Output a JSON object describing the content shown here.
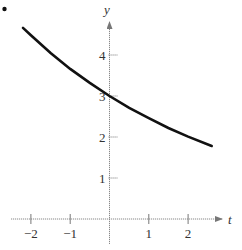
{
  "chart_data": {
    "type": "line",
    "title": "",
    "xlabel": "t",
    "ylabel": "y",
    "x_ticks": [
      -2,
      -1,
      1,
      2
    ],
    "x_tick_labels": [
      "−2",
      "−1",
      "1",
      "2"
    ],
    "y_ticks": [
      1,
      2,
      3,
      4
    ],
    "y_tick_labels": [
      "1",
      "2",
      "3",
      "4"
    ],
    "xlim": [
      -2.5,
      2.9
    ],
    "ylim": [
      -0.4,
      5.2
    ],
    "grid": false,
    "legend": null,
    "series": [
      {
        "name": "y = 3e^(-0.2t)",
        "x": [
          -2.2,
          -2,
          -1.5,
          -1,
          -0.5,
          0,
          0.5,
          1,
          1.5,
          2,
          2.6
        ],
        "y": [
          4.66,
          4.48,
          4.05,
          3.66,
          3.32,
          3.0,
          2.71,
          2.46,
          2.22,
          2.01,
          1.78
        ]
      }
    ],
    "annotations": [
      {
        "type": "bullet",
        "position": "top-left"
      }
    ],
    "color": "#111111"
  }
}
